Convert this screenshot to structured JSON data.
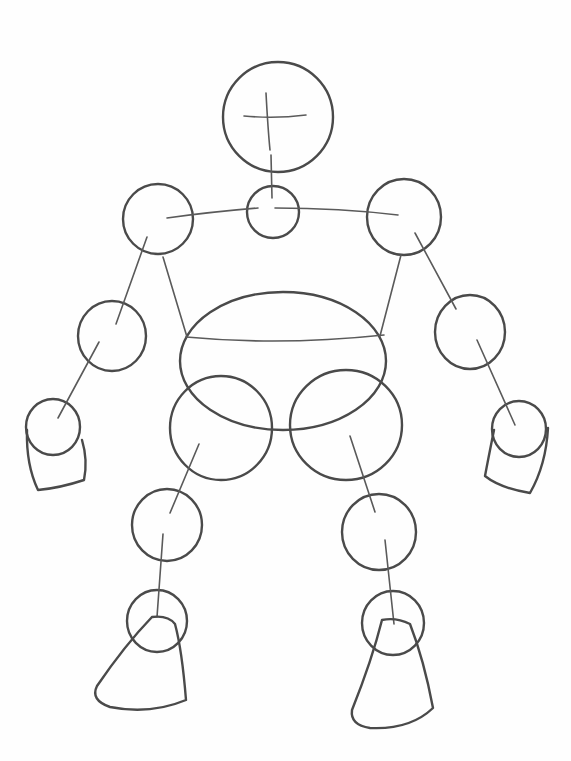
{
  "drawing": {
    "title": "Robot figure construction sketch",
    "width": 571,
    "height": 761,
    "background": "#fefefe",
    "stroke_color": "#4a4a4a",
    "circles": [
      {
        "name": "head-circle",
        "cx": 278,
        "cy": 117,
        "rx": 55,
        "ry": 55
      },
      {
        "name": "neck-circle",
        "cx": 273,
        "cy": 212,
        "rx": 26,
        "ry": 26
      },
      {
        "name": "left-shoulder-circle",
        "cx": 158,
        "cy": 219,
        "rx": 35,
        "ry": 35
      },
      {
        "name": "right-shoulder-circle",
        "cx": 404,
        "cy": 217,
        "rx": 37,
        "ry": 38
      },
      {
        "name": "left-elbow-circle",
        "cx": 112,
        "cy": 336,
        "rx": 34,
        "ry": 35
      },
      {
        "name": "right-elbow-circle",
        "cx": 470,
        "cy": 332,
        "rx": 35,
        "ry": 37
      },
      {
        "name": "left-wrist-circle",
        "cx": 53,
        "cy": 427,
        "rx": 27,
        "ry": 28
      },
      {
        "name": "right-wrist-circle",
        "cx": 519,
        "cy": 429,
        "rx": 27,
        "ry": 28
      },
      {
        "name": "torso-ellipse",
        "cx": 283,
        "cy": 361,
        "rx": 103,
        "ry": 69
      },
      {
        "name": "left-hip-circle",
        "cx": 221,
        "cy": 428,
        "rx": 51,
        "ry": 52
      },
      {
        "name": "right-hip-circle",
        "cx": 346,
        "cy": 425,
        "rx": 56,
        "ry": 55
      },
      {
        "name": "left-knee-circle",
        "cx": 167,
        "cy": 525,
        "rx": 35,
        "ry": 36
      },
      {
        "name": "right-knee-circle",
        "cx": 379,
        "cy": 532,
        "rx": 37,
        "ry": 38
      },
      {
        "name": "left-ankle-circle",
        "cx": 157,
        "cy": 621,
        "rx": 30,
        "ry": 31
      },
      {
        "name": "right-ankle-circle",
        "cx": 393,
        "cy": 623,
        "rx": 31,
        "ry": 32
      }
    ],
    "lines": [
      {
        "name": "head-vertical-guide",
        "d": "M266 93 Q268 130 270 150"
      },
      {
        "name": "head-horizontal-guide",
        "d": "M244 116 Q275 119 306 115"
      },
      {
        "name": "neck-spine-line",
        "d": "M271 155 L272 198"
      },
      {
        "name": "left-clavicle-line",
        "d": "M167 218 Q210 212 258 208"
      },
      {
        "name": "right-clavicle-line",
        "d": "M275 208 Q340 208 398 215"
      },
      {
        "name": "left-upper-arm-line",
        "d": "M147 237 L116 324"
      },
      {
        "name": "left-forearm-line",
        "d": "M99 342 L58 418"
      },
      {
        "name": "right-upper-arm-line",
        "d": "M415 233 L456 309"
      },
      {
        "name": "right-forearm-line",
        "d": "M477 340 L515 425"
      },
      {
        "name": "left-torso-side-line",
        "d": "M163 257 L187 337"
      },
      {
        "name": "right-torso-side-line",
        "d": "M401 255 L380 336"
      },
      {
        "name": "chest-horizontal-line",
        "d": "M186 337 Q280 346 384 335"
      },
      {
        "name": "left-thigh-line",
        "d": "M199 444 L170 513"
      },
      {
        "name": "right-thigh-line",
        "d": "M350 436 L375 512"
      },
      {
        "name": "left-shin-line",
        "d": "M163 534 L157 617"
      },
      {
        "name": "right-shin-line",
        "d": "M385 540 L394 624"
      },
      {
        "name": "left-hand-outline",
        "d": "M27 430 Q26 465 38 490 Q60 488 84 480 Q88 460 82 440"
      },
      {
        "name": "right-hand-outline",
        "d": "M494 430 Q488 460 485 476 Q500 488 530 493 Q546 465 548 428"
      },
      {
        "name": "left-foot-outline",
        "d": "M152 617 Q125 645 97 686 Q90 700 110 707 Q150 715 186 700 Q182 650 175 624 Q168 615 152 617"
      },
      {
        "name": "right-foot-outline",
        "d": "M382 620 Q372 660 352 710 Q350 725 370 728 Q410 730 433 708 Q424 660 410 624 Q396 617 382 620"
      }
    ]
  }
}
